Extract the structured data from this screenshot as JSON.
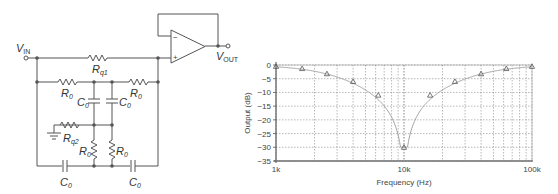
{
  "circuit": {
    "title": "Twin-T notch filter with unity-gain buffer",
    "labels": {
      "vin": "V",
      "vin_sub": "IN",
      "vout": "V",
      "vout_sub": "OUT",
      "rq1": "R",
      "rq1_sub": "q1",
      "rq2": "R",
      "rq2_sub": "q2",
      "r0": "R",
      "r0_sub": "0",
      "c0": "C",
      "c0_sub": "0"
    },
    "opamp": {
      "minus": "−",
      "plus": "+"
    }
  },
  "chart_data": {
    "type": "line",
    "title": "",
    "xlabel": "Frequency (Hz)",
    "ylabel": "Output (dB)",
    "xscale": "log",
    "xlim": [
      1000,
      100000
    ],
    "ylim": [
      -35,
      0
    ],
    "xtick_labels": [
      "1k",
      "10k",
      "100k"
    ],
    "ytick_labels": [
      "0",
      "−5",
      "−10",
      "−15",
      "−20",
      "−25",
      "−30",
      "−35"
    ],
    "yticks": [
      0,
      -5,
      -10,
      -15,
      -20,
      -25,
      -30,
      -35
    ],
    "grid": true,
    "marker": "triangle",
    "series": [
      {
        "name": "Measured",
        "x": [
          1000,
          1600,
          2500,
          4000,
          6300,
          10000,
          16000,
          25000,
          40000,
          63000,
          100000
        ],
        "y": [
          -0.5,
          -1.3,
          -3.2,
          -6.0,
          -11.0,
          -30.0,
          -11.0,
          -6.0,
          -3.2,
          -1.3,
          -0.5
        ]
      }
    ]
  }
}
